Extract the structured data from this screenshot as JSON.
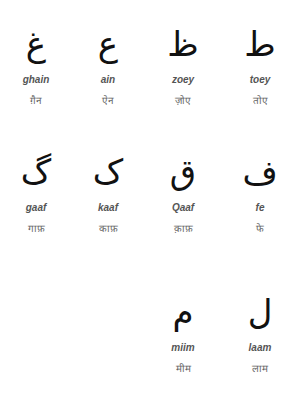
{
  "letters": [
    {
      "glyph": "غ",
      "latin": "ghain",
      "hindi": "ग़ैन"
    },
    {
      "glyph": "ع",
      "latin": "ain",
      "hindi": "ऐन"
    },
    {
      "glyph": "ظ",
      "latin": "zoey",
      "hindi": "ज़ोए"
    },
    {
      "glyph": "ط",
      "latin": "toey",
      "hindi": "तोए"
    },
    {
      "glyph": "گ",
      "latin": "gaaf",
      "hindi": "गाफ़"
    },
    {
      "glyph": "ک",
      "latin": "kaaf",
      "hindi": "काफ़"
    },
    {
      "glyph": "ق",
      "latin": "Qaaf",
      "hindi": "क़ाफ़"
    },
    {
      "glyph": "ف",
      "latin": "fe",
      "hindi": "फे"
    },
    {
      "glyph": "م",
      "latin": "miim",
      "hindi": "मीम"
    },
    {
      "glyph": "ل",
      "latin": "laam",
      "hindi": "लाम"
    }
  ]
}
